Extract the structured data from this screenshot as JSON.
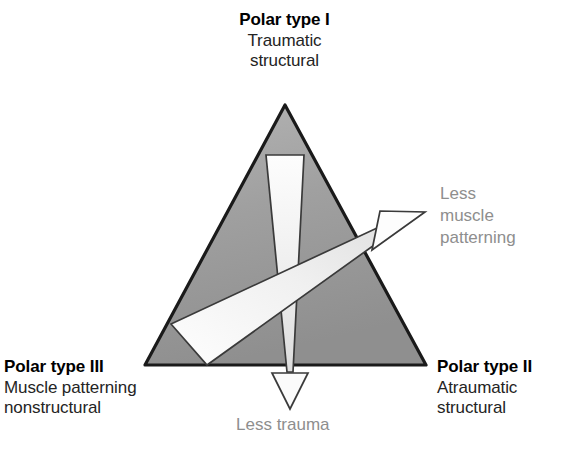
{
  "diagram": {
    "type": "triangular-classification",
    "shape": "triangle",
    "vertices": {
      "apex": {
        "x": 285,
        "y": 105
      },
      "bottom_left": {
        "x": 145,
        "y": 365
      },
      "bottom_right": {
        "x": 426,
        "y": 365
      }
    },
    "fill_color": "#9c9c9c",
    "stroke_color": "#1a1a1a",
    "background_color": "#ffffff"
  },
  "labels": {
    "type_1": {
      "title": "Polar type I",
      "sub_line_1": "Traumatic",
      "sub_line_2": "structural"
    },
    "type_2": {
      "title": "Polar type II",
      "sub_line_1": "Atraumatic",
      "sub_line_2": "structural"
    },
    "type_3": {
      "title": "Polar type III",
      "sub_line_1": "Muscle patterning",
      "sub_line_2": "nonstructural"
    }
  },
  "annotations": {
    "muscle_patterning": {
      "line_1": "Less",
      "line_2": "muscle",
      "line_3": "patterning",
      "color": "#8e8e8e",
      "arrow_direction": "upper-right"
    },
    "trauma": {
      "line_1": "Less trauma",
      "color": "#8e8e8e",
      "arrow_direction": "down"
    }
  },
  "wedges": {
    "vertical": {
      "name": "less-trauma-wedge",
      "orientation": "vertical",
      "tapers_toward": "bottom",
      "fill": "#f4f4f4"
    },
    "diagonal": {
      "name": "less-muscle-patterning-wedge",
      "orientation": "diagonal",
      "tapers_toward": "upper-right",
      "fill": "#f7f7f7"
    }
  }
}
